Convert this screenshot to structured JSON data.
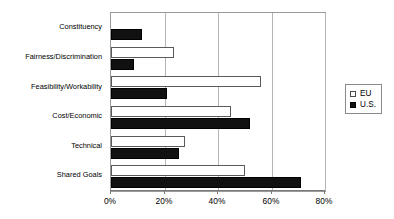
{
  "chart_data": {
    "type": "bar",
    "orientation": "horizontal",
    "title": "",
    "subtitle": "",
    "xlabel": "",
    "ylabel": "",
    "xlim": [
      0,
      80
    ],
    "xticks": [
      0,
      20,
      40,
      60,
      80
    ],
    "xtick_labels": [
      "0%",
      "20%",
      "40%",
      "60%",
      "80%"
    ],
    "grid": true,
    "grid_axis": "x",
    "legend_position": "right",
    "value_unit": "%",
    "categories": [
      "Constituency",
      "Fairness/Discrimination",
      "Feasibility/Workability",
      "Cost/Economic",
      "Technical",
      "Shared Goals"
    ],
    "series": [
      {
        "name": "EU",
        "color": "#ffffff",
        "edge_color": "#5a5a5a",
        "values": [
          0,
          23.5,
          56,
          45,
          27.5,
          50
        ]
      },
      {
        "name": "U.S.",
        "color": "#111111",
        "edge_color": "#000000",
        "values": [
          11.5,
          8.5,
          21,
          52,
          25.5,
          71
        ]
      }
    ]
  },
  "legend": {
    "entries": [
      {
        "label": "EU",
        "swatch": "hollow-square-icon"
      },
      {
        "label": "U.S.",
        "swatch": "filled-square-icon"
      }
    ]
  }
}
